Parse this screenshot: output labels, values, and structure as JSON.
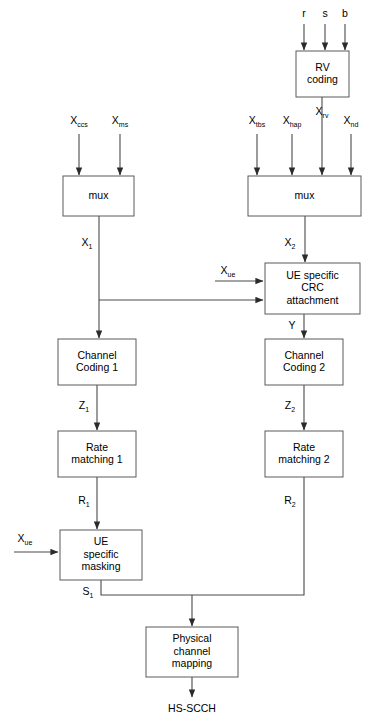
{
  "diagram": {
    "output_terminal": "HS-SCCH",
    "colors": {
      "background": "#ffffff",
      "box_stroke": "#5a5a5a",
      "line_stroke": "#4a4a4a",
      "text": "#000000"
    },
    "blocks": [
      {
        "id": "rv_coding",
        "label_lines": [
          "RV",
          "coding"
        ],
        "x": 296,
        "y": 51,
        "w": 53,
        "h": 46
      },
      {
        "id": "mux_left",
        "label_lines": [
          "mux"
        ],
        "x": 63,
        "y": 176,
        "w": 71,
        "h": 40
      },
      {
        "id": "mux_right",
        "label_lines": [
          "mux"
        ],
        "x": 248,
        "y": 176,
        "w": 113,
        "h": 40
      },
      {
        "id": "crc",
        "label_lines": [
          "UE specific",
          "CRC",
          "attachment"
        ],
        "x": 265,
        "y": 263,
        "w": 95,
        "h": 51
      },
      {
        "id": "chcode1",
        "label_lines": [
          "Channel",
          "Coding 1"
        ],
        "x": 58,
        "y": 339,
        "w": 78,
        "h": 46
      },
      {
        "id": "chcode2",
        "label_lines": [
          "Channel",
          "Coding 2"
        ],
        "x": 265,
        "y": 339,
        "w": 78,
        "h": 46
      },
      {
        "id": "ratematch1",
        "label_lines": [
          "Rate",
          "matching 1"
        ],
        "x": 58,
        "y": 431,
        "w": 78,
        "h": 46
      },
      {
        "id": "ratematch2",
        "label_lines": [
          "Rate",
          "matching 2"
        ],
        "x": 265,
        "y": 431,
        "w": 78,
        "h": 46
      },
      {
        "id": "masking",
        "label_lines": [
          "UE",
          "specific",
          "masking"
        ],
        "x": 60,
        "y": 530,
        "w": 82,
        "h": 50
      },
      {
        "id": "phymap",
        "label_lines": [
          "Physical",
          "channel",
          "mapping"
        ],
        "x": 146,
        "y": 627,
        "w": 92,
        "h": 50
      }
    ],
    "input_labels": [
      {
        "id": "in_r",
        "base": "r",
        "sub": "",
        "x": 304,
        "y": 17
      },
      {
        "id": "in_s",
        "base": "s",
        "sub": "",
        "x": 325,
        "y": 17
      },
      {
        "id": "in_b",
        "base": "b",
        "sub": "",
        "x": 345,
        "y": 17
      },
      {
        "id": "in_xccs",
        "base": "X",
        "sub": "ccs",
        "x": 79,
        "y": 124
      },
      {
        "id": "in_xms",
        "base": "X",
        "sub": "ms",
        "x": 120,
        "y": 124
      },
      {
        "id": "in_xtbs",
        "base": "X",
        "sub": "tbs",
        "x": 257,
        "y": 124
      },
      {
        "id": "in_xhap",
        "base": "X",
        "sub": "hap",
        "x": 292,
        "y": 124
      },
      {
        "id": "in_xrv",
        "base": "X",
        "sub": "rv",
        "x": 322,
        "y": 115
      },
      {
        "id": "in_xnd",
        "base": "X",
        "sub": "nd",
        "x": 351,
        "y": 124
      },
      {
        "id": "in_xue_1",
        "base": "X",
        "sub": "ue",
        "x": 228,
        "y": 274
      },
      {
        "id": "in_xue_2",
        "base": "X",
        "sub": "ue",
        "x": 25,
        "y": 542
      }
    ],
    "signal_labels": [
      {
        "id": "sig_x1",
        "base": "X",
        "sub": "1",
        "x": 87,
        "y": 246
      },
      {
        "id": "sig_x2",
        "base": "X",
        "sub": "2",
        "x": 290,
        "y": 246
      },
      {
        "id": "sig_y",
        "base": "Y",
        "sub": "",
        "x": 292,
        "y": 329
      },
      {
        "id": "sig_z1",
        "base": "Z",
        "sub": "1",
        "x": 84,
        "y": 409
      },
      {
        "id": "sig_z2",
        "base": "Z",
        "sub": "2",
        "x": 290,
        "y": 409
      },
      {
        "id": "sig_r1",
        "base": "R",
        "sub": "1",
        "x": 84,
        "y": 504
      },
      {
        "id": "sig_r2",
        "base": "R",
        "sub": "2",
        "x": 290,
        "y": 504
      },
      {
        "id": "sig_s1",
        "base": "S",
        "sub": "1",
        "x": 88,
        "y": 595
      }
    ]
  }
}
